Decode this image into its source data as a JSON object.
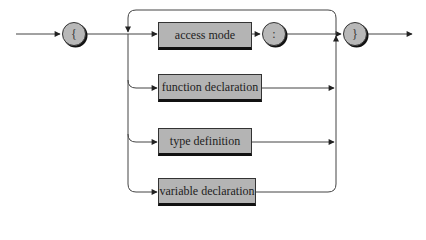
{
  "diagram": {
    "type": "syntax-railroad-diagram",
    "start_symbol": "{",
    "separator_symbol": ":",
    "end_symbol": "}",
    "alternatives": [
      {
        "label": "access mode",
        "followed_by": ":"
      },
      {
        "label": "function declaration"
      },
      {
        "label": "type definition"
      },
      {
        "label": "variable declaration"
      }
    ],
    "loop": "repeat back to branch point before alternatives",
    "colors": {
      "box_fill": "#b4b4b4",
      "line": "#333333",
      "shadow": "#111111",
      "background": "#ffffff"
    }
  }
}
